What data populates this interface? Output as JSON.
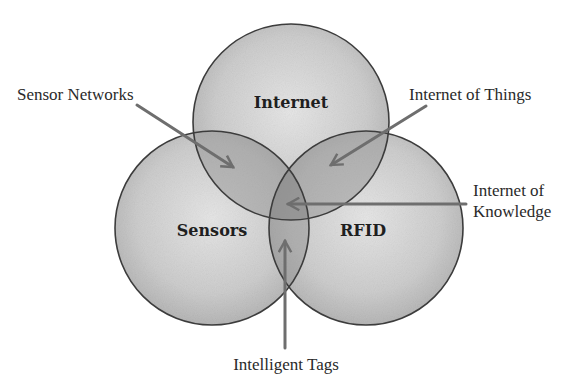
{
  "diagram": {
    "type": "venn",
    "background": "#ffffff",
    "colors": {
      "circle_fill_center": "#e4e4e4",
      "circle_fill_edge": "#b9b9b9",
      "overlap_shade": "#8c8c8c",
      "outline": "#3c3c3c",
      "arrow": "#6e6e6e",
      "text": "#2a2a2a"
    },
    "circles": [
      {
        "id": "internet",
        "label": "Internet",
        "cx": 291,
        "cy": 122,
        "r": 98,
        "label_x": 291,
        "label_y": 108
      },
      {
        "id": "sensors",
        "label": "Sensors",
        "cx": 212,
        "cy": 228,
        "r": 97,
        "label_x": 212,
        "label_y": 236
      },
      {
        "id": "rfid",
        "label": "RFID",
        "cx": 366,
        "cy": 228,
        "r": 97,
        "label_x": 363,
        "label_y": 236
      }
    ],
    "callouts": [
      {
        "id": "sensor-networks",
        "label": "Sensor Networks",
        "lines": [
          "Sensor Networks"
        ],
        "text_x": 17,
        "text_y": 100,
        "anchor": "start",
        "arrow": {
          "x1": 137,
          "y1": 105,
          "x2": 233,
          "y2": 167
        },
        "points_to": "Internet ∩ Sensors"
      },
      {
        "id": "internet-of-things",
        "label": "Internet of Things",
        "lines": [
          "Internet of Things"
        ],
        "text_x": 409,
        "text_y": 100,
        "anchor": "start",
        "arrow": {
          "x1": 426,
          "y1": 106,
          "x2": 331,
          "y2": 165
        },
        "points_to": "Internet ∩ RFID"
      },
      {
        "id": "internet-of-knowledge",
        "label": "Internet of Knowledge",
        "lines": [
          "Internet of",
          "Knowledge"
        ],
        "text_x": 473,
        "text_y": 196,
        "anchor": "start",
        "arrow": {
          "x1": 466,
          "y1": 204,
          "x2": 288,
          "y2": 204
        },
        "points_to": "Internet ∩ Sensors ∩ RFID"
      },
      {
        "id": "intelligent-tags",
        "label": "Intelligent Tags",
        "lines": [
          "Intelligent Tags"
        ],
        "text_x": 286,
        "text_y": 370,
        "anchor": "middle",
        "arrow": {
          "x1": 285,
          "y1": 348,
          "x2": 285,
          "y2": 241
        },
        "points_to": "Sensors ∩ RFID"
      }
    ]
  }
}
